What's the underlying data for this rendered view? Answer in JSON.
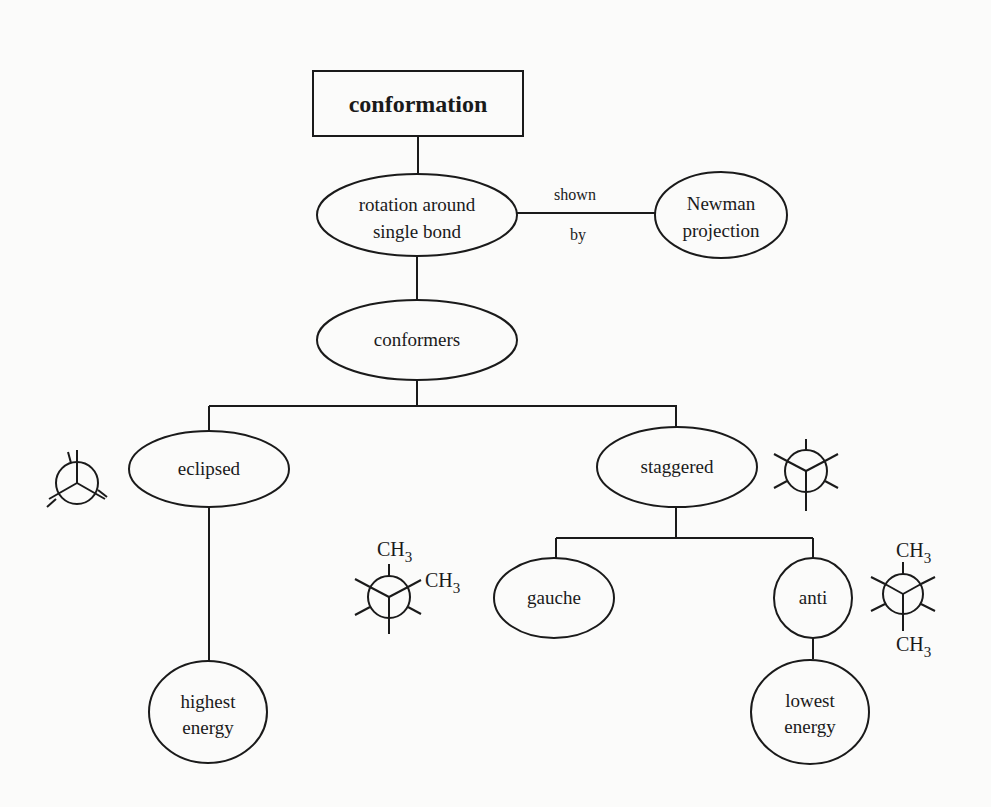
{
  "diagram": {
    "type": "concept-map",
    "nodes": {
      "conformation": {
        "label": "conformation",
        "shape": "rectangle"
      },
      "rotation": {
        "line1": "rotation around",
        "line2": "single bond",
        "shape": "ellipse"
      },
      "newman": {
        "line1": "Newman",
        "line2": "projection",
        "shape": "ellipse"
      },
      "conformers": {
        "label": "conformers",
        "shape": "ellipse"
      },
      "eclipsed": {
        "label": "eclipsed",
        "shape": "ellipse"
      },
      "staggered": {
        "label": "staggered",
        "shape": "ellipse"
      },
      "gauche": {
        "label": "gauche",
        "shape": "ellipse"
      },
      "anti": {
        "label": "anti",
        "shape": "ellipse"
      },
      "highest_energy": {
        "line1": "highest",
        "line2": "energy",
        "shape": "ellipse"
      },
      "lowest_energy": {
        "line1": "lowest",
        "line2": "energy",
        "shape": "ellipse"
      }
    },
    "edges": [
      {
        "from": "conformation",
        "to": "rotation",
        "label": ""
      },
      {
        "from": "rotation",
        "to": "newman",
        "label_top": "shown",
        "label_bottom": "by"
      },
      {
        "from": "rotation",
        "to": "conformers",
        "label": ""
      },
      {
        "from": "conformers",
        "to": "eclipsed",
        "label": ""
      },
      {
        "from": "conformers",
        "to": "staggered",
        "label": ""
      },
      {
        "from": "eclipsed",
        "to": "highest_energy",
        "label": ""
      },
      {
        "from": "staggered",
        "to": "gauche",
        "label": ""
      },
      {
        "from": "staggered",
        "to": "anti",
        "label": ""
      },
      {
        "from": "anti",
        "to": "lowest_energy",
        "label": ""
      }
    ],
    "edge_labels": {
      "shown": "shown",
      "by": "by"
    },
    "newman_icons": {
      "eclipsed": {
        "name": "eclipsed-newman-projection",
        "substituents": []
      },
      "staggered": {
        "name": "staggered-newman-projection",
        "substituents": []
      },
      "gauche": {
        "name": "gauche-newman-projection",
        "substituents": [
          "CH3",
          "CH3"
        ],
        "ch3_main": "CH",
        "ch3_sub": "3"
      },
      "anti": {
        "name": "anti-newman-projection",
        "substituents": [
          "CH3",
          "CH3"
        ],
        "ch3_main": "CH",
        "ch3_sub": "3"
      }
    }
  }
}
